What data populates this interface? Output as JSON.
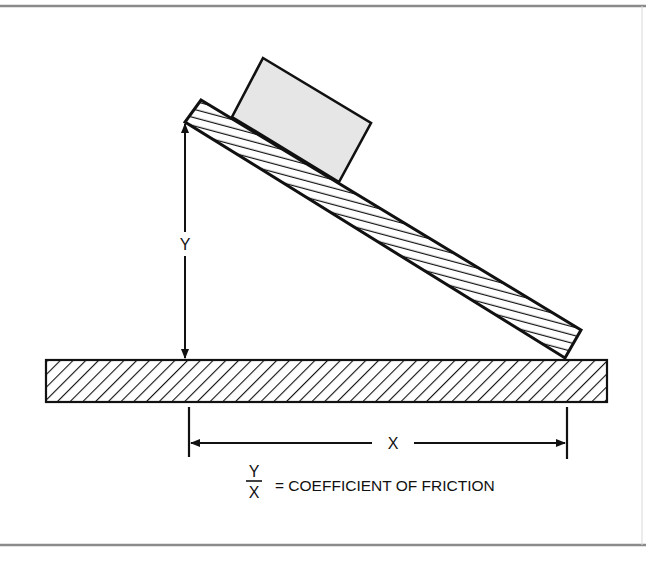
{
  "diagram": {
    "labels": {
      "rise": "Y",
      "run": "X",
      "fraction_numerator": "Y",
      "fraction_denominator": "X",
      "equation_text": "= COEFFICIENT OF FRICTION"
    },
    "elements": {
      "block": "block on incline",
      "ramp": "hatched inclined plank",
      "base": "hatched base slab",
      "rise_dimension": "vertical dimension arrow Y",
      "run_dimension": "horizontal dimension arrow X"
    },
    "colors": {
      "stroke": "#111111",
      "block_fill": "#e6e6e6",
      "frame": "#8a8a8a",
      "background": "#ffffff"
    }
  }
}
